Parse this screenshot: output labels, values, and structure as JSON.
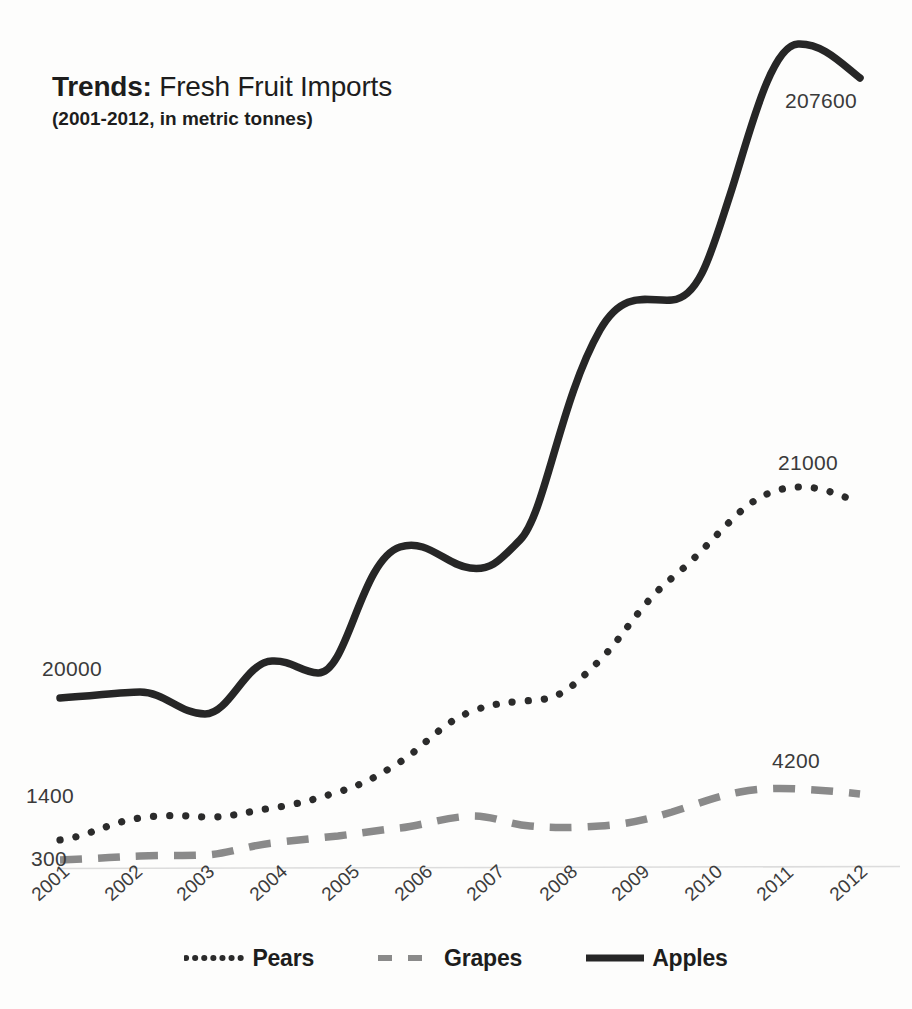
{
  "title": {
    "lead": "Trends:",
    "rest": " Fresh Fruit Imports",
    "subtitle": "(2001-2012, in metric tonnes)"
  },
  "labels": {
    "apples_start": "20000",
    "apples_end": "207600",
    "pears_start": "1400",
    "pears_end": "21000",
    "grapes_start": "300",
    "grapes_end": "4200"
  },
  "legend": {
    "items": [
      {
        "label": "Pears",
        "style": "dotted",
        "color": "#2b2b2b"
      },
      {
        "label": "Grapes",
        "style": "dashed",
        "color": "#8a8a8a"
      },
      {
        "label": "Apples",
        "style": "solid",
        "color": "#262626"
      }
    ]
  },
  "axis": {
    "baseline_color": "#d9d9d9",
    "tick_labels": [
      "2001",
      "2002",
      "2003",
      "2004",
      "2005",
      "2006",
      "2007",
      "2008",
      "2009",
      "2010",
      "2011",
      "2012"
    ]
  },
  "chart_data": {
    "type": "line",
    "title": "Trends: Fresh Fruit Imports",
    "subtitle": "(2001-2012, in metric tonnes)",
    "xlabel": "",
    "ylabel": "metric tonnes",
    "grid": false,
    "legend_position": "bottom",
    "axis_scale": "independent-per-series (endpoints labelled only)",
    "categories": [
      "2001",
      "2002",
      "2003",
      "2004",
      "2005",
      "2006",
      "2007",
      "2008",
      "2009",
      "2010",
      "2011",
      "2012"
    ],
    "series": [
      {
        "name": "Apples",
        "style": "solid",
        "color": "#262626",
        "endpoint_labels": {
          "start": 20000,
          "end": 207600
        },
        "values": [
          20000,
          20200,
          18800,
          24600,
          24000,
          33400,
          31600,
          34600,
          48000,
          52000,
          75000,
          71000
        ]
      },
      {
        "name": "Pears",
        "style": "dotted",
        "color": "#2b2b2b",
        "endpoint_labels": {
          "start": 1400,
          "end": 21000
        },
        "values": [
          1400,
          2600,
          2500,
          2900,
          3600,
          5000,
          7300,
          7800,
          11600,
          15400,
          21000,
          20200
        ]
      },
      {
        "name": "Grapes",
        "style": "dashed",
        "color": "#8a8a8a",
        "endpoint_labels": {
          "start": 300,
          "end": 4200
        },
        "values": [
          300,
          420,
          480,
          900,
          1200,
          1600,
          2200,
          1800,
          1850,
          2600,
          4200,
          4050
        ]
      }
    ]
  }
}
